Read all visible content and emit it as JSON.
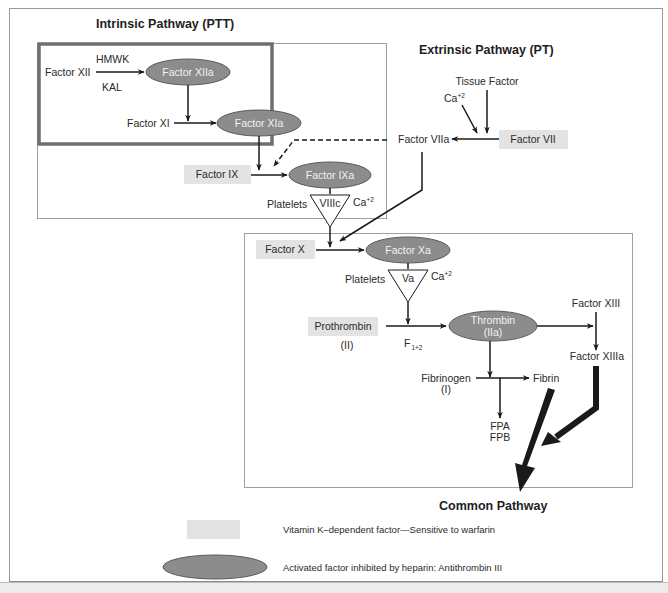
{
  "diagram": {
    "titles": {
      "intrinsic": "Intrinsic Pathway (PTT)",
      "extrinsic": "Extrinsic Pathway (PT)",
      "common": "Common Pathway"
    },
    "intrinsic": {
      "factor_xii": "Factor XII",
      "hmwk": "HMWK",
      "kal": "KAL",
      "factor_xiia": "Factor XIIa",
      "factor_xi": "Factor XI",
      "factor_xia": "Factor XIa",
      "factor_ix": "Factor IX",
      "factor_ixa": "Factor IXa",
      "platelets": "Platelets",
      "viiic": "VIIIc",
      "ca": "Ca",
      "ca_sup": "+2"
    },
    "extrinsic": {
      "tissue_factor": "Tissue Factor",
      "ca": "Ca",
      "ca_sup": "+2",
      "factor_viia": "Factor VIIa",
      "factor_vii": "Factor VII"
    },
    "common": {
      "factor_x": "Factor X",
      "factor_xa": "Factor Xa",
      "platelets": "Platelets",
      "va": "Va",
      "ca": "Ca",
      "ca_sup": "+2",
      "prothrombin": "Prothrombin",
      "prothrombin_roman": "(II)",
      "f_main": "F",
      "f_sub": "1+2",
      "thrombin": "Thrombin",
      "thrombin_roman": "(IIa)",
      "factor_xiii": "Factor XIII",
      "factor_xiiia": "Factor XIIIa",
      "fibrinogen": "Fibrinogen",
      "fibrinogen_roman": "(I)",
      "fibrin": "Fibrin",
      "fpa": "FPA",
      "fpb": "FPB"
    },
    "legend": {
      "vitamin_k": "Vitamin K–dependent factor—Sensitive to warfarin",
      "heparin": "Activated factor inhibited by heparin: Antithrombin III"
    },
    "colors": {
      "enzyme_fill": "#8c8c8c",
      "enzyme_stroke": "#5a5a5a",
      "vitk_fill": "#e3e3e3",
      "thick_box": "#6f6f6f",
      "thin_box": "#a0a0a0",
      "arrow": "#1a1a1a"
    }
  }
}
